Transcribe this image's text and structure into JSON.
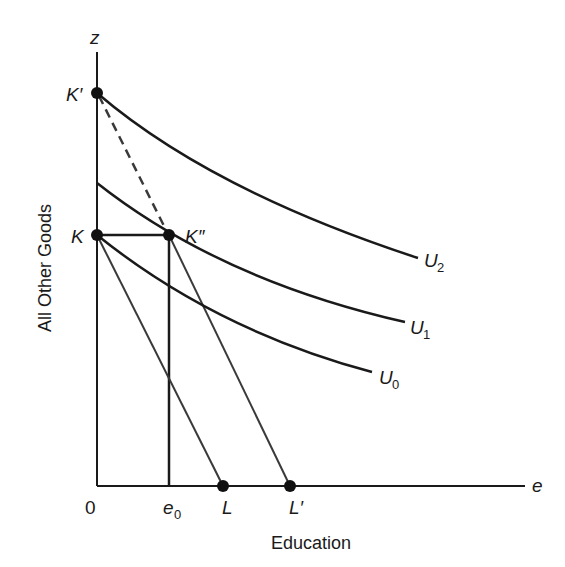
{
  "figure": {
    "type": "indifference-curve-diagram",
    "axes": {
      "y_axis_symbol": "z",
      "x_axis_symbol": "e",
      "y_axis_label": "All Other Goods",
      "x_axis_label": "Education",
      "origin_label": "0"
    },
    "points": {
      "K_prime": "K′",
      "K": "K",
      "K_double_prime": "K″",
      "L": "L",
      "L_prime": "L′",
      "e0_base": "e",
      "e0_sub": "0"
    },
    "curves": [
      {
        "name": "U",
        "sub": "2"
      },
      {
        "name": "U",
        "sub": "1"
      },
      {
        "name": "U",
        "sub": "0"
      }
    ],
    "colors": {
      "line": "#1a1a1a",
      "budget": "#3a3a3a",
      "background": "#ffffff"
    }
  }
}
